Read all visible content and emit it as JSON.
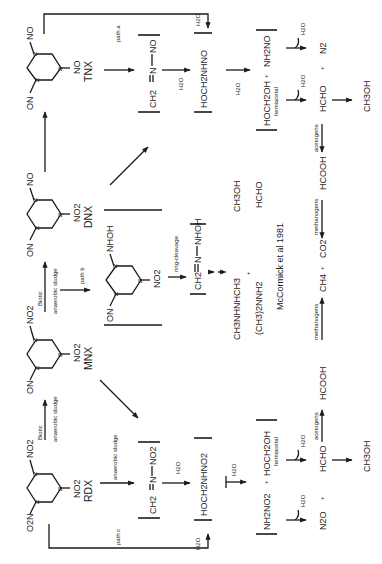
{
  "figure": {
    "orientation": "rotated 90 degrees counter-clockwise",
    "compounds": {
      "rdx": {
        "label": "RDX",
        "substituents": [
          "O2N",
          "NO2",
          "NO2"
        ]
      },
      "mnx": {
        "label": "MNX",
        "substituents": [
          "ON",
          "NO2",
          "NO2"
        ]
      },
      "dnx": {
        "label": "DNX",
        "substituents": [
          "ON",
          "NO2",
          "NO"
        ]
      },
      "tnx": {
        "label": "TNX",
        "substituents": [
          "ON",
          "NO",
          "NO"
        ]
      },
      "hydroxylamino": {
        "substituents": [
          "ON",
          "NHOH",
          "NO2"
        ]
      }
    },
    "arrow_labels": {
      "biotic_1": "Biotic",
      "sludge_1": "anaerobic sludge",
      "biotic_2": "Biotic",
      "sludge_2": "anaerobic sludge",
      "path_a": "path a",
      "path_b": "path b",
      "path_c": "path c",
      "anaerobic_sludge_c": "anaerobic sludge",
      "ring_cleavage": "ring-cleavage",
      "acetogens_1": "acetogens",
      "acetogens_2": "acetogens",
      "methanogens_1": "methanogens",
      "methanogens_2": "methanogens"
    },
    "intermediates": {
      "a_imine": {
        "left": "CH2",
        "mid": "N",
        "right": "NO"
      },
      "a_h2o": "H2O",
      "a_hoch2nhno": "HOCH2NHNO",
      "a_h2o_2": "H2O",
      "a_hemiacetal": "HOCH2OH",
      "a_plus": "+",
      "a_nh2no": "NH2NO",
      "a_hemiacetal_label": "hemiacetal",
      "a_h2o_left": "H2O",
      "a_h2o_right": "H2O",
      "a_top_h2o": "H2O",
      "c_imine": {
        "left": "CH2",
        "mid": "N",
        "right": "NO2"
      },
      "c_h2o": "H2O",
      "c_hoch2nhno2": "HOCH2NHNO2",
      "c_h2o_2": "H2O",
      "c_nh2no2": "NH2NO2",
      "c_plus": "+",
      "c_hemiacetal": "HOCH2OH",
      "c_hemiacetal_label": "hemiacetal",
      "c_h2o_left": "H2O",
      "c_h2o_right": "H2O",
      "c_bottom_h2o": "H2O",
      "b_imine": {
        "left": "CH2",
        "mid": "N",
        "right": "NHOH"
      }
    },
    "products": {
      "a_hcho": "HCHO",
      "a_plus": "+",
      "a_n2": "N2",
      "a_ch3oh": "CH3OH",
      "a_hcooh": "HCOOH",
      "b_ch3nhnhch3": "CH3NHNHCH3",
      "b_ch32nnh2": "(CH3)2NNH2",
      "b_plus": "+",
      "b_ch3oh": "CH3OH",
      "b_hcho": "HCHO",
      "b_citation": "McCormick et al 1981",
      "ch4": "CH4",
      "co2": "CO2",
      "mid_plus": "+",
      "c_n2o": "N2O",
      "c_plus": "+",
      "c_hcho": "HCHO",
      "c_ch3oh": "CH3OH",
      "c_hcooh": "HCOOH"
    }
  }
}
